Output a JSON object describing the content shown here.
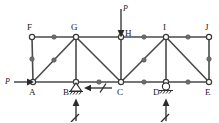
{
  "figure": {
    "type": "truss-diagram",
    "title": "",
    "colors": {
      "member": "#4a4a4a",
      "node": "#3a3a3a",
      "mid_dot": "#6e6e6e",
      "force": "#2a2a2a",
      "background": "#ffffff"
    }
  },
  "nodes": [
    {
      "id": "F",
      "label": "F",
      "x": 32,
      "y": 37,
      "label_x": 27,
      "label_y": 30
    },
    {
      "id": "G",
      "label": "G",
      "x": 76,
      "y": 37,
      "label_x": 71,
      "label_y": 30
    },
    {
      "id": "H",
      "label": "H",
      "x": 121,
      "y": 37,
      "label_x": 125,
      "label_y": 36
    },
    {
      "id": "I",
      "label": "I",
      "x": 166,
      "y": 37,
      "label_x": 162,
      "label_y": 30
    },
    {
      "id": "J",
      "label": "J",
      "x": 209,
      "y": 37,
      "label_x": 204,
      "label_y": 30
    },
    {
      "id": "A",
      "label": "A",
      "x": 33,
      "y": 82,
      "label_x": 28,
      "label_y": 95
    },
    {
      "id": "B",
      "label": "B",
      "x": 76,
      "y": 82,
      "label_x": 62,
      "label_y": 95
    },
    {
      "id": "C",
      "label": "C",
      "x": 121,
      "y": 82,
      "label_x": 117,
      "label_y": 95
    },
    {
      "id": "D",
      "label": "D",
      "x": 166,
      "y": 82,
      "label_x": 152,
      "label_y": 95
    },
    {
      "id": "E",
      "label": "E",
      "x": 209,
      "y": 82,
      "label_x": 204,
      "label_y": 95
    }
  ],
  "members": [
    {
      "from": "F",
      "to": "G",
      "kind": "top-chord"
    },
    {
      "from": "G",
      "to": "H",
      "kind": "top-chord"
    },
    {
      "from": "H",
      "to": "I",
      "kind": "top-chord"
    },
    {
      "from": "I",
      "to": "J",
      "kind": "top-chord"
    },
    {
      "from": "A",
      "to": "B",
      "kind": "bottom-chord"
    },
    {
      "from": "B",
      "to": "C",
      "kind": "bottom-chord"
    },
    {
      "from": "C",
      "to": "D",
      "kind": "bottom-chord"
    },
    {
      "from": "D",
      "to": "E",
      "kind": "bottom-chord"
    },
    {
      "from": "F",
      "to": "A",
      "kind": "vertical"
    },
    {
      "from": "G",
      "to": "B",
      "kind": "vertical"
    },
    {
      "from": "H",
      "to": "C",
      "kind": "vertical"
    },
    {
      "from": "I",
      "to": "D",
      "kind": "vertical"
    },
    {
      "from": "J",
      "to": "E",
      "kind": "vertical"
    },
    {
      "from": "A",
      "to": "G",
      "kind": "diagonal"
    },
    {
      "from": "G",
      "to": "C",
      "kind": "diagonal"
    },
    {
      "from": "C",
      "to": "I",
      "kind": "diagonal"
    },
    {
      "from": "I",
      "to": "E",
      "kind": "diagonal"
    }
  ],
  "mid_dots": [
    {
      "on": "F-G",
      "x": 54,
      "y": 37
    },
    {
      "on": "H-I",
      "x": 144,
      "y": 37
    },
    {
      "on": "I-J",
      "x": 188,
      "y": 37
    },
    {
      "on": "F-A",
      "x": 32,
      "y": 59
    },
    {
      "on": "J-E",
      "x": 209,
      "y": 59
    },
    {
      "on": "A-G",
      "x": 54,
      "y": 60
    },
    {
      "on": "C-I",
      "x": 144,
      "y": 60
    },
    {
      "on": "B-C",
      "x": 99,
      "y": 82
    },
    {
      "on": "C-D",
      "x": 144,
      "y": 82
    },
    {
      "on": "D-E",
      "x": 188,
      "y": 82
    }
  ],
  "loads": [
    {
      "id": "load-P-at-A",
      "label": "P",
      "label_x": 7,
      "label_y": 82,
      "direction": "right",
      "applied_at": "A",
      "from_x": 14,
      "from_y": 82,
      "to_x": 33,
      "to_y": 82
    },
    {
      "id": "load-P-at-H",
      "label": "P",
      "label_x": 124,
      "label_y": 12,
      "direction": "down",
      "applied_at": "H",
      "from_x": 121,
      "from_y": 8,
      "to_x": 121,
      "to_y": 37
    }
  ],
  "reactions": [
    {
      "id": "reaction-horizontal-at-B",
      "label": "",
      "direction": "left",
      "applied_at": "B",
      "from_x": 112,
      "from_y": 88,
      "to_x": 84,
      "to_y": 88,
      "has_slash": true
    },
    {
      "id": "reaction-vertical-at-B",
      "label": "",
      "direction": "up",
      "applied_at": "B",
      "from_x": 76,
      "from_y": 120,
      "to_x": 76,
      "to_y": 99,
      "has_slash": true
    },
    {
      "id": "reaction-vertical-at-D",
      "label": "",
      "direction": "up",
      "applied_at": "D",
      "from_x": 166,
      "from_y": 120,
      "to_x": 166,
      "to_y": 99,
      "has_slash": true
    }
  ],
  "supports": [
    {
      "id": "support-B",
      "at": "B",
      "type": "pin",
      "x": 76,
      "y": 82,
      "hatch_count": 4
    },
    {
      "id": "support-D",
      "at": "D",
      "type": "roller",
      "x": 166,
      "y": 82,
      "hatch_count": 4
    }
  ]
}
